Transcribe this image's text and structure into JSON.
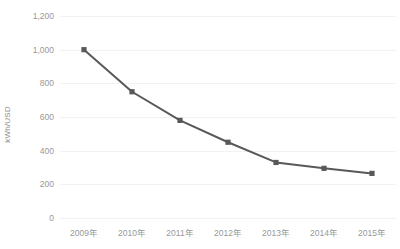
{
  "chart_data": {
    "type": "line",
    "title": "",
    "subtitle": "",
    "xlabel": "",
    "ylabel": "kWh/USD",
    "categories": [
      "2009年",
      "2010年",
      "2011年",
      "2012年",
      "2013年",
      "2014年",
      "2015年"
    ],
    "values": [
      1000,
      750,
      580,
      450,
      330,
      295,
      265
    ],
    "series": [
      {
        "name": "kWh/USD",
        "values": [
          1000,
          750,
          580,
          450,
          330,
          295,
          265
        ]
      }
    ],
    "ylim": [
      0,
      1200
    ],
    "y_ticks": [
      0,
      200,
      400,
      600,
      800,
      1000,
      1200
    ],
    "y_tick_labels": [
      "0",
      "200",
      "400",
      "600",
      "800",
      "1,000",
      "1,200"
    ],
    "grid": true,
    "grid_axis": "y",
    "legend": false,
    "legend_position": "none",
    "markers": true,
    "line_color": "#595959",
    "marker_color": "#595959",
    "grid_color": "#f2f2f2",
    "tick_label_color": "#999999",
    "axis_title_color": "#8c8c8c",
    "background_color": "#ffffff"
  }
}
